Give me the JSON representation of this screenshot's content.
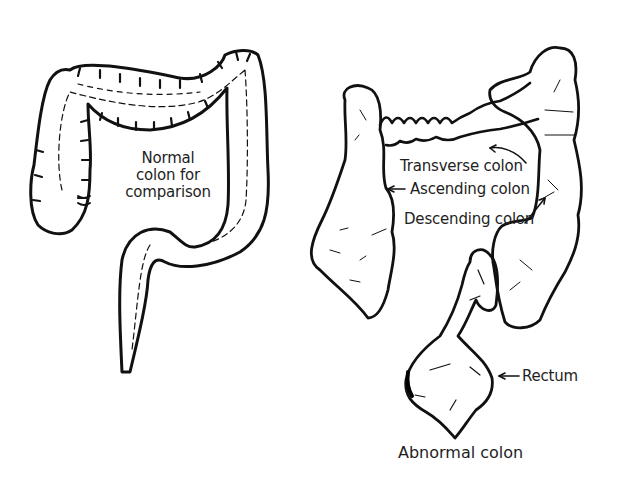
{
  "diagram": {
    "normal_colon": {
      "label_lines": [
        "Normal",
        "colon for",
        "comparison"
      ]
    },
    "abnormal_colon": {
      "caption": "Abnormal colon",
      "labels": {
        "transverse": "Transverse colon",
        "ascending": "Ascending colon",
        "descending": "Descending colon",
        "rectum": "Rectum"
      }
    },
    "colors": {
      "ink": "#111111",
      "background": "#ffffff"
    }
  }
}
